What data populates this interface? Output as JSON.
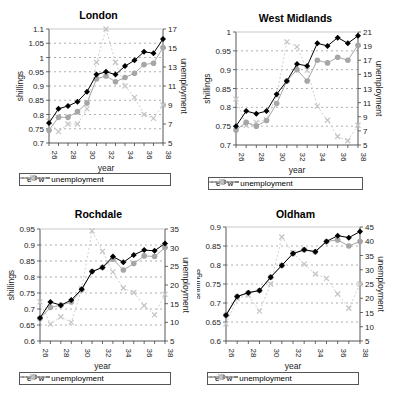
{
  "chart_data": [
    {
      "type": "line",
      "title": "London",
      "xlabel": "year",
      "ylabel": "shillings",
      "y2label": "unemployment",
      "x": [
        26,
        27,
        28,
        29,
        30,
        31,
        32,
        33,
        34,
        35,
        36,
        37,
        38
      ],
      "xticks": [
        "26",
        "28",
        "30",
        "32",
        "34",
        "36",
        "38"
      ],
      "ylim": [
        0.7,
        1.1
      ],
      "yticks": [
        "0.7",
        "0.75",
        "0.8",
        "0.85",
        "0.9",
        "0.95",
        "1",
        "1.05",
        "1.1"
      ],
      "y2lim": [
        5,
        17
      ],
      "y2ticks": [
        "5",
        "7",
        "9",
        "11",
        "13",
        "15",
        "17"
      ],
      "series": [
        {
          "name": "e",
          "axis": "left",
          "values": [
            0.77,
            0.82,
            0.83,
            0.845,
            0.88,
            0.94,
            0.95,
            0.94,
            0.97,
            0.99,
            1.02,
            1.015,
            1.065
          ]
        },
        {
          "name": "w",
          "axis": "left",
          "values": [
            0.745,
            0.79,
            0.79,
            0.81,
            0.84,
            0.925,
            0.935,
            0.915,
            0.93,
            0.945,
            0.975,
            0.98,
            1.035
          ]
        },
        {
          "name": "unemployment",
          "axis": "right",
          "values": [
            7.3,
            6.2,
            7,
            7,
            8.6,
            13.5,
            17,
            13.5,
            11,
            9.8,
            8,
            7.6,
            9
          ]
        }
      ],
      "grid": true,
      "legend_position": "bottom"
    },
    {
      "type": "line",
      "title": "West Midlands",
      "xlabel": "year",
      "ylabel": "shillings",
      "y2label": "unemployment",
      "x": [
        26,
        27,
        28,
        29,
        30,
        31,
        32,
        33,
        34,
        35,
        36,
        37,
        38
      ],
      "xticks": [
        "26",
        "28",
        "30",
        "32",
        "34",
        "36",
        "38"
      ],
      "ylim": [
        0.7,
        1.0
      ],
      "yticks": [
        "0.7",
        "0.75",
        "0.8",
        "0.85",
        "0.9",
        "0.95",
        "1"
      ],
      "y2lim": [
        5,
        21
      ],
      "y2ticks": [
        "5",
        "7",
        "9",
        "11",
        "13",
        "15",
        "17",
        "19",
        "21"
      ],
      "series": [
        {
          "name": "e",
          "axis": "left",
          "values": [
            0.75,
            0.79,
            0.783,
            0.79,
            0.835,
            0.87,
            0.915,
            0.91,
            0.97,
            0.963,
            0.985,
            0.97,
            0.99
          ]
        },
        {
          "name": "w",
          "axis": "left",
          "values": [
            0.74,
            0.76,
            0.75,
            0.765,
            0.81,
            0.87,
            0.9,
            0.87,
            0.925,
            0.918,
            0.933,
            0.925,
            0.965
          ]
        },
        {
          "name": "unemployment",
          "axis": "right",
          "values": [
            11.5,
            7.8,
            8.2,
            8.6,
            12,
            19.6,
            18.9,
            15.6,
            10.5,
            8.5,
            6.2,
            5.6,
            7.8
          ]
        }
      ],
      "grid": true,
      "legend_position": "bottom"
    },
    {
      "type": "line",
      "title": "Rochdale",
      "xlabel": "year",
      "ylabel": "shillings",
      "y2label": "unemployment",
      "x": [
        26,
        27,
        28,
        29,
        30,
        31,
        32,
        33,
        34,
        35,
        36,
        37,
        38
      ],
      "xticks": [
        "26",
        "28",
        "30",
        "32",
        "34",
        "36",
        "38"
      ],
      "ylim": [
        0.6,
        0.95
      ],
      "yticks": [
        "0.6",
        "0.65",
        "0.7",
        "0.75",
        "0.8",
        "0.85",
        "0.9",
        "0.95"
      ],
      "y2lim": [
        5,
        35
      ],
      "y2ticks": [
        "5",
        "10",
        "15",
        "20",
        "25",
        "30",
        "35"
      ],
      "series": [
        {
          "name": "e",
          "axis": "left",
          "values": [
            0.672,
            0.722,
            0.712,
            0.728,
            0.762,
            0.817,
            0.83,
            0.864,
            0.846,
            0.869,
            0.884,
            0.882,
            0.905
          ]
        },
        {
          "name": "w",
          "axis": "left",
          "values": [
            0.67,
            0.705,
            0.712,
            0.722,
            0.76,
            0.817,
            0.83,
            0.856,
            0.822,
            0.842,
            0.866,
            0.864,
            0.892
          ]
        },
        {
          "name": "unemployment",
          "axis": "right",
          "values": [
            15.5,
            9.5,
            11.5,
            10,
            19,
            34.5,
            29,
            23.5,
            19.2,
            18,
            14.5,
            12,
            17.5
          ]
        }
      ],
      "grid": true,
      "legend_position": "bottom"
    },
    {
      "type": "line",
      "title": "Oldham",
      "xlabel": "year",
      "ylabel": "shillings",
      "y2label": "unemployment",
      "x": [
        26,
        27,
        28,
        29,
        30,
        31,
        32,
        33,
        34,
        35,
        36,
        37,
        38
      ],
      "xticks": [
        "26",
        "28",
        "30",
        "32",
        "34",
        "36",
        "38"
      ],
      "ylim": [
        0.6,
        0.9
      ],
      "yticks": [
        "0.6",
        "0.65",
        "0.7",
        "0.75",
        "0.8",
        "0.85",
        "0.9"
      ],
      "y2lim": [
        5,
        45
      ],
      "y2ticks": [
        "5",
        "10",
        "15",
        "20",
        "25",
        "30",
        "35",
        "40",
        "45"
      ],
      "series": [
        {
          "name": "e",
          "axis": "left",
          "values": [
            0.668,
            0.717,
            0.727,
            0.733,
            0.768,
            0.799,
            0.83,
            0.84,
            0.835,
            0.862,
            0.877,
            0.872,
            0.888
          ]
        },
        {
          "name": "w",
          "axis": "left",
          "values": [
            0.668,
            0.717,
            0.727,
            0.733,
            0.768,
            0.799,
            0.83,
            0.84,
            0.835,
            0.862,
            0.866,
            0.85,
            0.862
          ]
        },
        {
          "name": "unemployment",
          "axis": "right",
          "values": [
            11,
            20,
            21,
            15.5,
            25,
            41.5,
            36,
            32,
            28.5,
            27,
            21.5,
            16.5,
            25
          ]
        }
      ],
      "grid": true,
      "legend_position": "bottom"
    }
  ],
  "legend": {
    "e": "e",
    "w": "w",
    "unemployment": "unemployment"
  },
  "colors": {
    "e": "#000000",
    "w": "#a6a6a6",
    "unemployment": "#d0d0d0",
    "grid": "#9a9a9a",
    "axis": "#444444"
  }
}
